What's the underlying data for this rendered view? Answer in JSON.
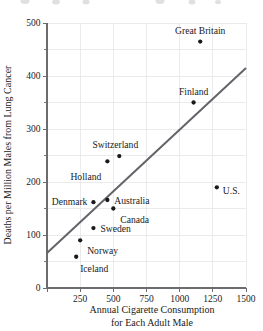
{
  "chart_data": {
    "type": "scatter",
    "title": "",
    "xlabel": "Annual Cigarette Consumption for Each Adult Male",
    "xlabel_line1": "Annual Cigarette Consumption",
    "xlabel_line2": "for Each Adult Male",
    "ylabel": "Deaths per Million Males from Lung Cancer",
    "xlim": [
      0,
      1500
    ],
    "ylim": [
      0,
      500
    ],
    "xticks": [
      0,
      250,
      500,
      750,
      1000,
      1250,
      1500
    ],
    "xtick_labels": [
      "",
      "250",
      "500",
      "750",
      "1000",
      "1250",
      "1500"
    ],
    "yticks": [
      0,
      100,
      200,
      300,
      400,
      500
    ],
    "ytick_labels": [
      "0",
      "100",
      "200",
      "300",
      "400",
      "500"
    ],
    "yticks_minor": [
      50,
      150,
      250,
      350,
      450
    ],
    "grid": true,
    "grid_color": "#e3e3e6",
    "legend": "none",
    "point_color": "#1a1a1a",
    "line_color": "#63636a",
    "points": [
      {
        "label": "Iceland",
        "x": 220,
        "y": 59,
        "label_dx": 4,
        "label_dy": 15,
        "anchor": "start"
      },
      {
        "label": "Norway",
        "x": 250,
        "y": 90,
        "label_dx": 7,
        "label_dy": 14,
        "anchor": "start"
      },
      {
        "label": "Sweden",
        "x": 350,
        "y": 113,
        "label_dx": 7,
        "label_dy": 4,
        "anchor": "start"
      },
      {
        "label": "Canada",
        "x": 500,
        "y": 150,
        "label_dx": 7,
        "label_dy": 14,
        "anchor": "start"
      },
      {
        "label": "Denmark",
        "x": 350,
        "y": 162,
        "label_dx": -6,
        "label_dy": 3,
        "anchor": "end"
      },
      {
        "label": "Australia",
        "x": 455,
        "y": 166,
        "label_dx": 7,
        "label_dy": 4,
        "anchor": "start"
      },
      {
        "label": "Holland",
        "x": 455,
        "y": 239,
        "label_dx": -6,
        "label_dy": 19,
        "anchor": "end"
      },
      {
        "label": "Switzerland",
        "x": 545,
        "y": 249,
        "label_dx": -4,
        "label_dy": -8,
        "anchor": "middle"
      },
      {
        "label": "U.S.",
        "x": 1280,
        "y": 190,
        "label_dx": 6,
        "label_dy": 7,
        "anchor": "start"
      },
      {
        "label": "Finland",
        "x": 1105,
        "y": 350,
        "label_dx": 0,
        "label_dy": -8,
        "anchor": "middle"
      },
      {
        "label": "Great Britain",
        "x": 1155,
        "y": 465,
        "label_dx": 0,
        "label_dy": -8,
        "anchor": "middle"
      }
    ],
    "trendline": {
      "x0": 0,
      "y0": 66,
      "x1": 1500,
      "y1": 415
    }
  }
}
